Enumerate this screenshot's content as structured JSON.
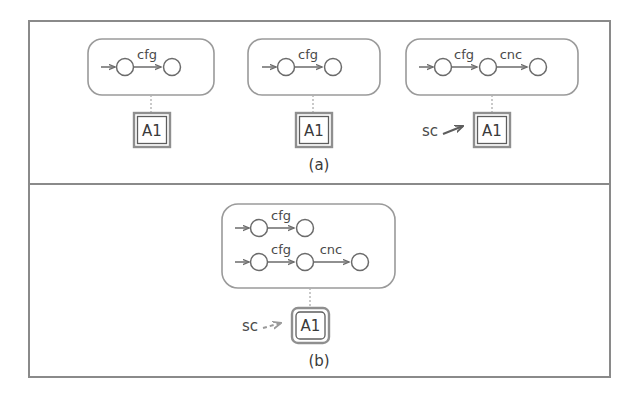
{
  "figure": {
    "caption_a": "(a)",
    "caption_b": "(b)",
    "colors": {
      "frame": "#8a8a8a",
      "group_box": "#9a9a9a",
      "node": "#6b6b6b",
      "edge": "#6b6b6b",
      "connector": "#b3b3b3",
      "annotation_box": "#5d5d5d",
      "text": "#3d3d3d",
      "background": "#ffffff"
    },
    "panels": [
      {
        "id": "panel-a",
        "caption": "(a)",
        "groups": [
          {
            "id": "group-a-1",
            "chains": [
              {
                "id": "chain-a-1",
                "nodes": [
                  "node",
                  "node"
                ],
                "edge_labels": [
                  "cfg"
                ],
                "has_entry_arrow": true
              }
            ],
            "annotation": {
              "label": "A1",
              "style": "single-square",
              "connector": "dotted",
              "source_label": null,
              "source_arrow": null
            }
          },
          {
            "id": "group-a-2",
            "chains": [
              {
                "id": "chain-a-2",
                "nodes": [
                  "node",
                  "node"
                ],
                "edge_labels": [
                  "cfg"
                ],
                "has_entry_arrow": true
              }
            ],
            "annotation": {
              "label": "A1",
              "style": "single-square",
              "connector": "dotted",
              "source_label": null,
              "source_arrow": null
            }
          },
          {
            "id": "group-a-3",
            "chains": [
              {
                "id": "chain-a-3",
                "nodes": [
                  "node",
                  "node",
                  "node"
                ],
                "edge_labels": [
                  "cfg",
                  "cnc"
                ],
                "has_entry_arrow": true
              }
            ],
            "annotation": {
              "label": "A1",
              "style": "single-square",
              "connector": "dotted",
              "source_label": "sc",
              "source_arrow": "solid"
            }
          }
        ]
      },
      {
        "id": "panel-b",
        "caption": "(b)",
        "groups": [
          {
            "id": "group-b-1",
            "chains": [
              {
                "id": "chain-b-1",
                "nodes": [
                  "node",
                  "node"
                ],
                "edge_labels": [
                  "cfg"
                ],
                "has_entry_arrow": true
              },
              {
                "id": "chain-b-2",
                "nodes": [
                  "node",
                  "node",
                  "node"
                ],
                "edge_labels": [
                  "cfg",
                  "cnc"
                ],
                "has_entry_arrow": true
              }
            ],
            "annotation": {
              "label": "A1",
              "style": "double-rounded",
              "connector": "solid",
              "source_label": "sc",
              "source_arrow": "dashed"
            }
          }
        ]
      }
    ],
    "labels": {
      "cfg": "cfg",
      "cnc": "cnc",
      "a1": "A1",
      "sc": "sc"
    }
  }
}
